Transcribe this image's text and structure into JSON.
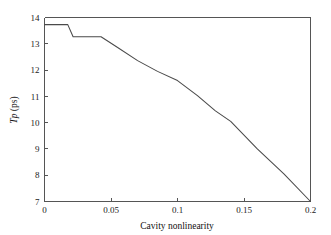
{
  "chart_data": {
    "type": "line",
    "title": "",
    "xlabel": "Cavity nonlinearity",
    "ylabel": "Tp (ps)",
    "ylabel_italic_part": "Tp",
    "ylabel_roman_part": " (ps)",
    "xlim": [
      0,
      0.2
    ],
    "ylim": [
      7,
      14
    ],
    "xticks": [
      0,
      0.05,
      0.1,
      0.15,
      0.2
    ],
    "xtick_labels": [
      "0",
      "0.05",
      "0.1",
      "0.15",
      "0.2"
    ],
    "yticks": [
      7,
      8,
      9,
      10,
      11,
      12,
      13,
      14
    ],
    "ytick_labels": [
      "7",
      "8",
      "9",
      "10",
      "11",
      "12",
      "13",
      "14"
    ],
    "grid": false,
    "legend": false,
    "line_color": "#4a4a4a",
    "series": [
      {
        "name": "Pulse duration",
        "x": [
          0.0,
          0.0175,
          0.0215,
          0.0425,
          0.055,
          0.07,
          0.085,
          0.1,
          0.115,
          0.1285,
          0.14,
          0.16,
          0.18,
          0.2
        ],
        "values": [
          13.73,
          13.73,
          13.27,
          13.27,
          12.86,
          12.36,
          11.95,
          11.6,
          11.03,
          10.45,
          10.05,
          9.0,
          8.05,
          7.0
        ]
      }
    ]
  },
  "figure": {
    "background_color": "#ffffff",
    "axis_color": "#555555"
  }
}
